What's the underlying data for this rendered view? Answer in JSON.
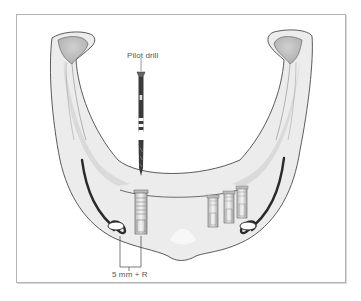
{
  "figure": {
    "labels": {
      "pilot_drill": "Pilot drill",
      "dimension": "5 mm + R"
    },
    "implants": {
      "left_count": 1,
      "right_count": 3
    },
    "colors": {
      "bone_fill": "#ececec",
      "bone_shade": "#c9c9c9",
      "outline": "#4a4a4a",
      "canal": "#2a2a2a",
      "frame_border": "#b4b4b4",
      "text": "#555555"
    }
  }
}
